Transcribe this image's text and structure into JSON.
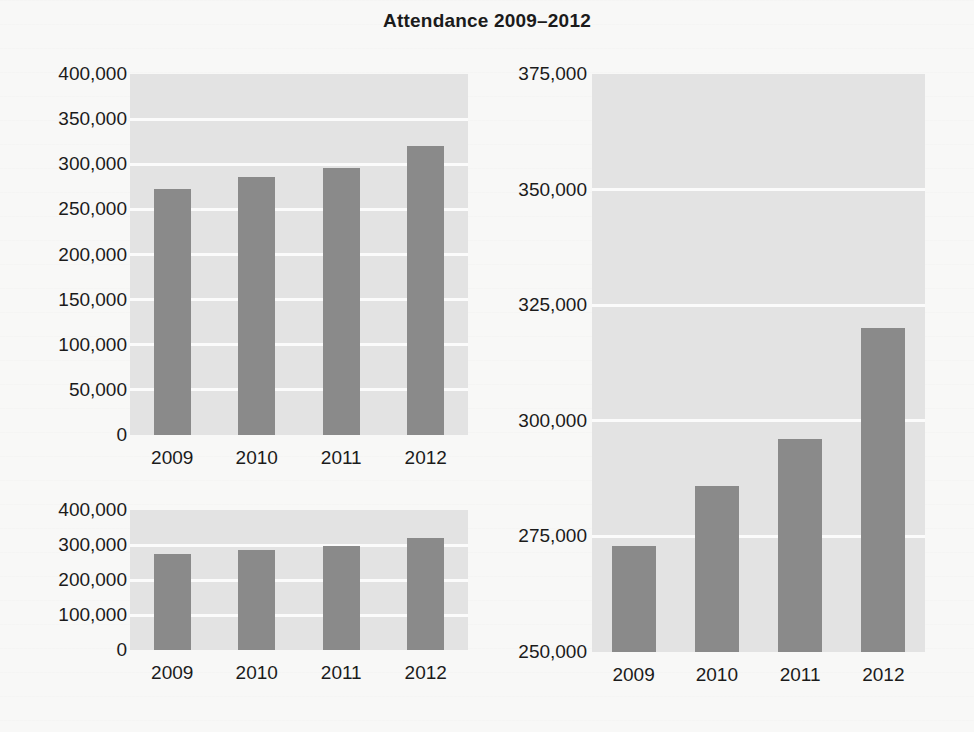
{
  "page": {
    "title": "Attendance 2009–2012",
    "background_color": "#f8f8f7",
    "bar_color": "#8a8a8a",
    "plot_background_color": "#e3e3e3",
    "gridline_color": "#fbfbfb",
    "text_color": "#1b1b1b"
  },
  "chart_data": [
    {
      "id": "top-left",
      "type": "bar",
      "title": "",
      "xlabel": "",
      "ylabel": "",
      "categories": [
        "2009",
        "2010",
        "2011",
        "2012"
      ],
      "values": [
        273000,
        286000,
        296000,
        320000
      ],
      "ylim": [
        0,
        400000
      ],
      "yticks": [
        0,
        50000,
        100000,
        150000,
        200000,
        250000,
        300000,
        350000,
        400000
      ],
      "ytick_labels": [
        "0",
        "50,000",
        "100,000",
        "150,000",
        "200,000",
        "250,000",
        "300,000",
        "350,000",
        "400,000"
      ],
      "grid": true,
      "legend": false
    },
    {
      "id": "bottom-left",
      "type": "bar",
      "title": "",
      "xlabel": "",
      "ylabel": "",
      "categories": [
        "2009",
        "2010",
        "2011",
        "2012"
      ],
      "values": [
        273000,
        286000,
        296000,
        320000
      ],
      "ylim": [
        0,
        400000
      ],
      "yticks": [
        0,
        100000,
        200000,
        300000,
        400000
      ],
      "ytick_labels": [
        "0",
        "100,000",
        "200,000",
        "300,000",
        "400,000"
      ],
      "grid": true,
      "legend": false
    },
    {
      "id": "right",
      "type": "bar",
      "title": "",
      "xlabel": "",
      "ylabel": "",
      "categories": [
        "2009",
        "2010",
        "2011",
        "2012"
      ],
      "values": [
        273000,
        286000,
        296000,
        320000
      ],
      "ylim": [
        250000,
        375000
      ],
      "yticks": [
        250000,
        275000,
        300000,
        325000,
        350000,
        375000
      ],
      "ytick_labels": [
        "250,000",
        "275,000",
        "300,000",
        "325,000",
        "350,000",
        "375,000"
      ],
      "grid": true,
      "legend": false
    }
  ]
}
